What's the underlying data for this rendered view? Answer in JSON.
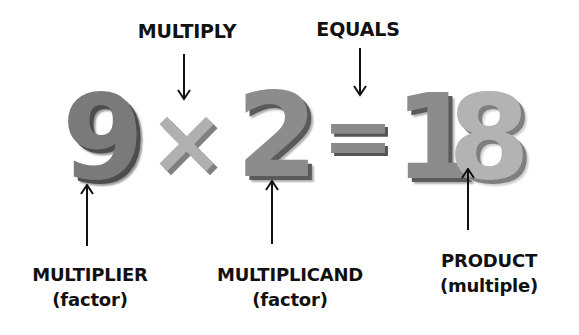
{
  "equation": {
    "multiplier": "9",
    "operator": "×",
    "multiplicand": "2",
    "equals": "=",
    "product_tens": "1",
    "product_ones": "8"
  },
  "labels": {
    "multiply": "MULTIPLY",
    "equals": "EQUALS",
    "multiplier": {
      "line1": "MULTIPLIER",
      "line2": "(factor)"
    },
    "multiplicand": {
      "line1": "MULTIPLICAND",
      "line2": "(factor)"
    },
    "product": {
      "line1": "PRODUCT",
      "line2": "(multiple)"
    }
  },
  "colors": {
    "text": "#111111",
    "background": "#ffffff",
    "number_dark": "#7a7a7a",
    "number_light": "#b3b3b3"
  }
}
